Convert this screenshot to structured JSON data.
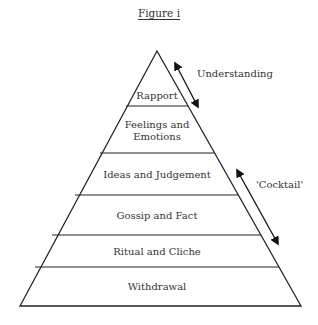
{
  "figure": {
    "caption": "Figure i",
    "layers": [
      {
        "label": "Rapport"
      },
      {
        "label": "Feelings and Emotions",
        "line1": "Feelings and",
        "line2": "Emotions"
      },
      {
        "label": "Ideas and Judgement"
      },
      {
        "label": "Gossip and Fact"
      },
      {
        "label": "Ritual and Cliche"
      },
      {
        "label": "Withdrawal"
      }
    ],
    "arrows": [
      {
        "label": "Understanding"
      },
      {
        "label": "'Cocktail'"
      }
    ],
    "colors": {
      "stroke": "#222222",
      "text": "#333333",
      "background": "#ffffff"
    }
  }
}
